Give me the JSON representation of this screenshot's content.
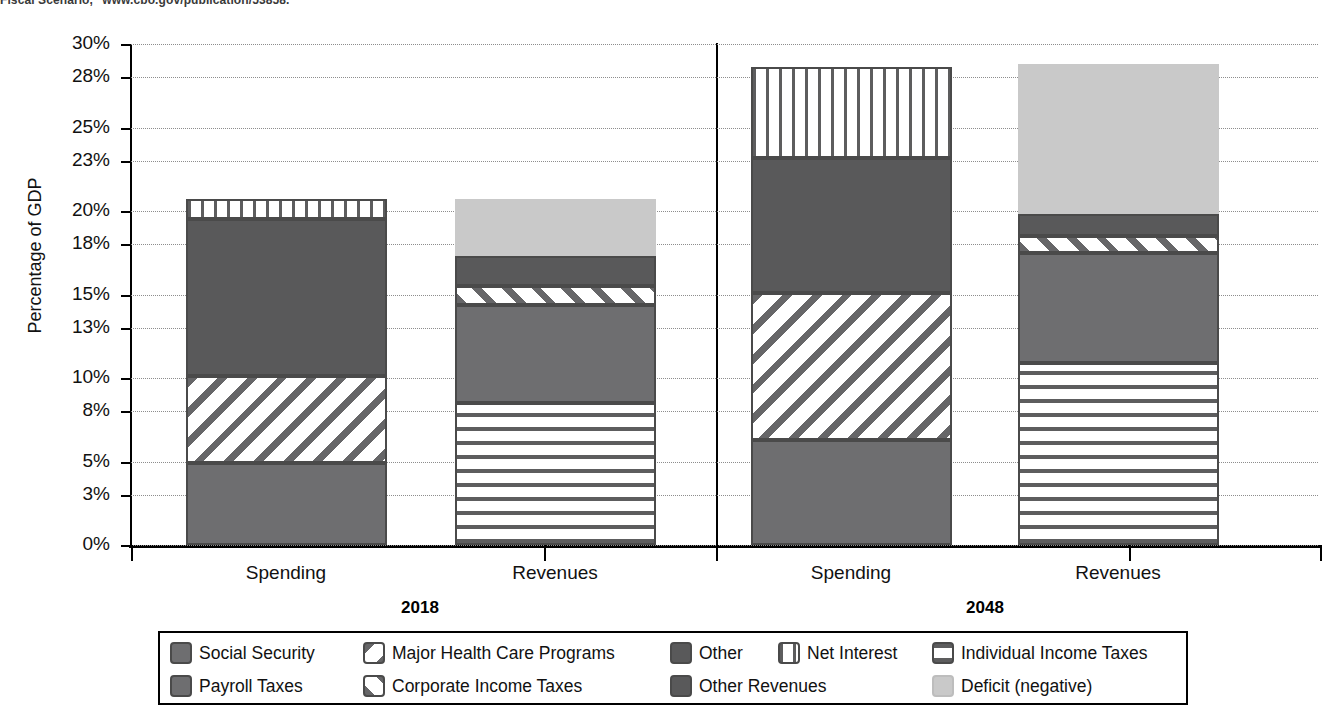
{
  "source_note": "Fiscal Scenario,\" www.cbo.gov/publication/53858.",
  "axis": {
    "y_title": "Percentage of GDP",
    "y_ticks": [
      "30%",
      "28%",
      "25%",
      "23%",
      "20%",
      "18%",
      "15%",
      "13%",
      "10%",
      "8%",
      "5%",
      "3%",
      "0%"
    ]
  },
  "groups": [
    {
      "year": "2018",
      "bars": [
        {
          "label": "Spending"
        },
        {
          "label": "Revenues"
        }
      ]
    },
    {
      "year": "2048",
      "bars": [
        {
          "label": "Spending"
        },
        {
          "label": "Revenues"
        }
      ]
    }
  ],
  "legend": {
    "row1": [
      {
        "label": "Social Security",
        "swatch": "solid-medium-gray-swatch"
      },
      {
        "label": "Major Health Care Programs",
        "swatch": "backslash-hatch-swatch"
      },
      {
        "label": "Other",
        "swatch": "solid-dark-gray-swatch"
      },
      {
        "label": "Net Interest",
        "swatch": "vertical-lines-swatch"
      },
      {
        "label": "Individual Income Taxes",
        "swatch": "horizontal-lines-swatch"
      }
    ],
    "row2": [
      {
        "label": "Payroll Taxes",
        "swatch": "solid-medium-gray-swatch"
      },
      {
        "label": "Corporate Income Taxes",
        "swatch": "forwardslash-hatch-swatch"
      },
      {
        "label": "Other Revenues",
        "swatch": "solid-dark-gray-swatch"
      },
      {
        "label": "Deficit (negative)",
        "swatch": "light-gray-swatch"
      }
    ]
  },
  "colors": {
    "medium_gray": "#6e6e70",
    "dark_gray": "#59595a",
    "light_gray": "#c9c9c9",
    "hatch_gray": "#666668",
    "axis_black": "#000000",
    "gridline_gray": "#8d8d8d"
  },
  "chart_data": {
    "type": "bar",
    "title": "",
    "subtitle": "",
    "xlabel": "",
    "ylabel": "Percentage of GDP",
    "ylim": [
      0,
      30
    ],
    "ytick_values": [
      30,
      28,
      25,
      23,
      20,
      18,
      15,
      13,
      10,
      8,
      5,
      3,
      0
    ],
    "ytick_labels": [
      "30%",
      "28%",
      "25%",
      "23%",
      "20%",
      "18%",
      "15%",
      "13%",
      "10%",
      "8%",
      "5%",
      "3%",
      "0%"
    ],
    "grid": true,
    "stacked": true,
    "legend_position": "bottom",
    "categories": [
      "2018 Spending",
      "2018 Revenues",
      "2048 Spending",
      "2048 Revenues"
    ],
    "bars": [
      {
        "group": "2018",
        "category": "Spending",
        "total": 20.7,
        "segments": [
          {
            "name": "Social Security",
            "value": 4.9,
            "pattern": "solid-medium"
          },
          {
            "name": "Major Health Care Programs",
            "value": 5.2,
            "pattern": "backslash"
          },
          {
            "name": "Other",
            "value": 9.4,
            "pattern": "solid-dark"
          },
          {
            "name": "Net Interest",
            "value": 1.2,
            "pattern": "vertical"
          }
        ]
      },
      {
        "group": "2018",
        "category": "Revenues",
        "total": 20.7,
        "segments": [
          {
            "name": "Individual Income Taxes",
            "value": 8.5,
            "pattern": "horizontal"
          },
          {
            "name": "Payroll Taxes",
            "value": 5.9,
            "pattern": "solid-medium"
          },
          {
            "name": "Corporate Income Taxes",
            "value": 1.1,
            "pattern": "forwardslash"
          },
          {
            "name": "Other Revenues",
            "value": 1.8,
            "pattern": "solid-dark"
          },
          {
            "name": "Deficit (negative)",
            "value": 3.4,
            "pattern": "light"
          }
        ]
      },
      {
        "group": "2048",
        "category": "Spending",
        "total": 28.6,
        "segments": [
          {
            "name": "Social Security",
            "value": 6.3,
            "pattern": "solid-medium"
          },
          {
            "name": "Major Health Care Programs",
            "value": 8.8,
            "pattern": "backslash"
          },
          {
            "name": "Other",
            "value": 8.1,
            "pattern": "solid-dark"
          },
          {
            "name": "Net Interest",
            "value": 5.4,
            "pattern": "vertical"
          }
        ]
      },
      {
        "group": "2048",
        "category": "Revenues",
        "total": 28.8,
        "segments": [
          {
            "name": "Individual Income Taxes",
            "value": 10.9,
            "pattern": "horizontal"
          },
          {
            "name": "Payroll Taxes",
            "value": 6.6,
            "pattern": "solid-medium"
          },
          {
            "name": "Corporate Income Taxes",
            "value": 1.0,
            "pattern": "forwardslash"
          },
          {
            "name": "Other Revenues",
            "value": 1.3,
            "pattern": "solid-dark"
          },
          {
            "name": "Deficit (negative)",
            "value": 9.0,
            "pattern": "light"
          }
        ]
      }
    ]
  }
}
